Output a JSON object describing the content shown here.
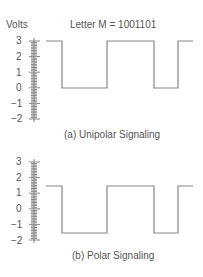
{
  "header": {
    "y_axis_label": "Volts",
    "title": "Letter M = 1001101"
  },
  "chart_data": [
    {
      "type": "line",
      "title": "Letter M = 1001101",
      "caption": "(a) Unipolar Signaling",
      "ylabel": "Volts",
      "yticks": [
        3,
        2,
        1,
        0,
        -1,
        -2
      ],
      "ylim": [
        -2,
        3
      ],
      "bits": [
        1,
        0,
        0,
        1,
        1,
        0,
        1
      ],
      "high_voltage": 3,
      "low_voltage": 0
    },
    {
      "type": "line",
      "caption": "(b) Polar Signaling",
      "ylabel": "Volts",
      "yticks": [
        3,
        2,
        1,
        0,
        -1,
        -2
      ],
      "ylim": [
        -2,
        3
      ],
      "bits": [
        1,
        0,
        0,
        1,
        1,
        0,
        1
      ],
      "high_voltage": 1.5,
      "low_voltage": -1.5
    }
  ],
  "unipolar": {
    "caption": "(a) Unipolar Signaling",
    "ticks": [
      "3",
      "2",
      "1",
      "0",
      "−1",
      "−2"
    ]
  },
  "polar": {
    "caption": "(b) Polar Signaling",
    "ticks": [
      "3",
      "2",
      "1",
      "0",
      "−1",
      "−2"
    ]
  },
  "colors": {
    "line": "#888888",
    "text": "#555555"
  }
}
